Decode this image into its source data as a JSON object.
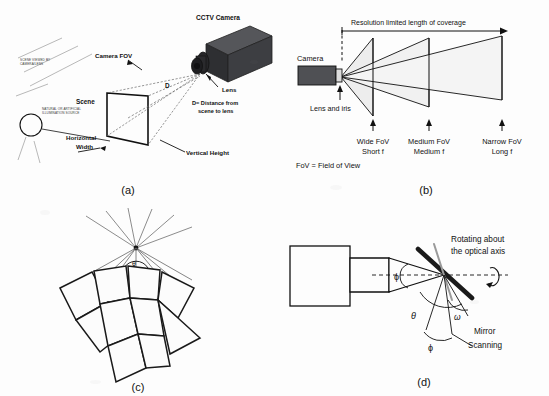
{
  "figure": {
    "background_color": "#fdfdfd",
    "ink_color": "#111111",
    "camera_body_color": "#4a4a4a",
    "fov_fill_color": "#efefef"
  },
  "panels": [
    {
      "id": "a",
      "caption": "(a)",
      "labels": {
        "camera": "CCTV Camera",
        "lens": "Lens",
        "camera_fov": "Camera FOV",
        "scene": "Scene",
        "distance_symbol": "D",
        "distance_note_line1": "D= Distance from",
        "distance_note_line2": "scene to lens",
        "horizontal_width_line1": "Horizontal",
        "horizontal_width_line2": "Width",
        "vertical_height": "Vertical Height",
        "scene_viewed_line1": "SCENE VIEWED BY",
        "scene_viewed_line2": "CAMERA/LENS",
        "illumination_line1": "NATURAL OR ARTIFICIAL",
        "illumination_line2": "ILLUMINATION SOURCE"
      }
    },
    {
      "id": "b",
      "caption": "(b)",
      "labels": {
        "coverage": "Resolution limited length of coverage",
        "camera": "Camera",
        "lens_and_iris": "Lens and iris",
        "fov_definition": "FoV = Field of View"
      },
      "fov_stops": [
        {
          "name": "Wide FoV",
          "focal": "Short f"
        },
        {
          "name": "Medium FoV",
          "focal": "Medium f"
        },
        {
          "name": "Narrow FoV",
          "focal": "Long f"
        }
      ]
    },
    {
      "id": "c",
      "caption": "(c)",
      "labels": {
        "theta": "θ",
        "phi": "ϕ"
      },
      "tile_count": 9
    },
    {
      "id": "d",
      "caption": "(d)",
      "labels": {
        "rotating_line1": "Rotating about",
        "rotating_line2": "the optical axis",
        "mirror": "Mirror",
        "scanning": "Scanning",
        "phi_axis": "ϕ",
        "theta": "θ",
        "omega": "ω",
        "phi_lower": "ϕ"
      }
    }
  ]
}
